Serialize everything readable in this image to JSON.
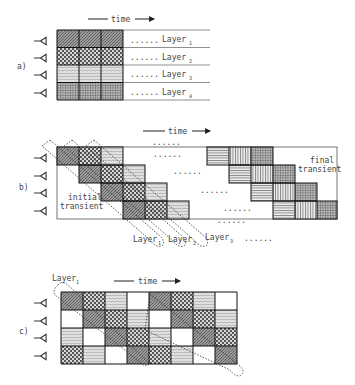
{
  "panels": {
    "a": {
      "label": "a)",
      "time_label": "time",
      "layers": [
        {
          "name": "Layer",
          "sub": "1",
          "pattern": "diag-dense"
        },
        {
          "name": "Layer",
          "sub": "2",
          "pattern": "dots-check"
        },
        {
          "name": "Layer",
          "sub": "3",
          "pattern": "waves"
        },
        {
          "name": "Layer",
          "sub": "4",
          "pattern": "grid"
        }
      ],
      "ellipsis": "......",
      "columns": 3
    },
    "b": {
      "label": "b)",
      "time_label": "time",
      "initial_transient": [
        "initial",
        "transient"
      ],
      "final_transient": [
        "final",
        "transient"
      ],
      "layer_labels": [
        {
          "name": "Layer",
          "sub": "1"
        },
        {
          "name": "Layer",
          "sub": "2"
        },
        {
          "name": "Layer",
          "sub": "3"
        }
      ],
      "ellipsis": "......",
      "left_patterns": [
        "diag-dense",
        "dots-check",
        "waves"
      ],
      "right_patterns": [
        "hlines",
        "vlines",
        "grid"
      ]
    },
    "c": {
      "label": "c)",
      "time_label": "time",
      "layer_label": {
        "name": "Layer",
        "sub": "1"
      },
      "grid": [
        [
          "diag-dense",
          "dots-check",
          "waves",
          "blank",
          "diag-dense",
          "dots-check",
          "waves",
          "blank"
        ],
        [
          "blank",
          "diag-dense",
          "dots-check",
          "waves",
          "blank",
          "diag-dense",
          "dots-check",
          "waves"
        ],
        [
          "waves",
          "blank",
          "diag-dense",
          "dots-check",
          "waves",
          "blank",
          "diag-dense",
          "dots-check"
        ],
        [
          "dots-check",
          "waves",
          "blank",
          "diag-dense",
          "dots-check",
          "waves",
          "blank",
          "diag-dense"
        ]
      ]
    }
  }
}
